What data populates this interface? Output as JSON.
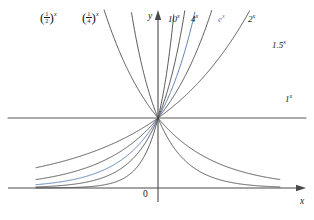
{
  "figure": {
    "type": "exponential-function-family",
    "background": "#ffffff",
    "curve_color": "#3c3c3c",
    "highlight_color": "#5a7fb5",
    "axis_color": "#4a4a4a"
  },
  "axes": {
    "x_label": "x",
    "y_label": "y",
    "origin_label": "0",
    "x_range": [
      -3.05,
      3.05
    ],
    "y_range": [
      -0.42,
      4.6
    ],
    "grid": false
  },
  "chart_data": {
    "type": "line",
    "title": "",
    "xlabel": "x",
    "ylabel": "y",
    "xlim": [
      -3.05,
      3.05
    ],
    "ylim": [
      -0.42,
      4.6
    ],
    "grid": false,
    "legend": "inline-curve-labels",
    "common_point": [
      0,
      1
    ],
    "series": [
      {
        "name": "(1/2)^x",
        "base": 0.5,
        "color": "#3c3c3c",
        "label_text": "(1/2)^x",
        "label_x": 52,
        "label_y": 18,
        "highlight": false
      },
      {
        "name": "(1/4)^x",
        "base": 0.25,
        "color": "#3c3c3c",
        "label_text": "(1/4)^x",
        "label_x": 92,
        "label_y": 18,
        "highlight": false
      },
      {
        "name": "10^x",
        "base": 10,
        "color": "#3c3c3c",
        "label_text": "10^x",
        "label_x": 172,
        "label_y": 20,
        "highlight": false
      },
      {
        "name": "4^x",
        "base": 4,
        "color": "#3c3c3c",
        "label_text": "4^x",
        "label_x": 194,
        "label_y": 20,
        "highlight": false
      },
      {
        "name": "e^x",
        "base": 2.718281828,
        "color": "#5a7fb5",
        "label_text": "e^x",
        "label_x": 222,
        "label_y": 20,
        "highlight": true
      },
      {
        "name": "2^x",
        "base": 2,
        "color": "#3c3c3c",
        "label_text": "2^x",
        "label_x": 250,
        "label_y": 20,
        "highlight": false
      },
      {
        "name": "1.5^x",
        "base": 1.5,
        "color": "#3c3c3c",
        "label_text": "1.5^x",
        "label_x": 272,
        "label_y": 44,
        "highlight": false
      },
      {
        "name": "1^x",
        "base": 1,
        "color": "#3c3c3c",
        "label_text": "1^x",
        "label_x": 284,
        "label_y": 98,
        "highlight": false
      }
    ]
  },
  "labels": {
    "half_base": "1",
    "half_den": "2",
    "quarter_base": "1",
    "quarter_den": "4",
    "ten": "10",
    "four": "4",
    "e": "e",
    "two": "2",
    "one_point_five": "1.5",
    "one": "1",
    "exponent": "x"
  }
}
